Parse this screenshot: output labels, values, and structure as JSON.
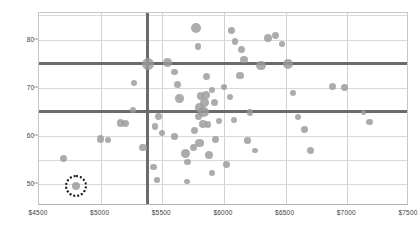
{
  "chart_data": {
    "type": "scatter",
    "title": "",
    "xlabel": "",
    "ylabel": "Treatment Recommended Conversion Rate (TRC)",
    "xlim": [
      4500,
      7500
    ],
    "ylim": [
      45.5,
      85.5
    ],
    "grid": true,
    "legend": null,
    "xticks": [
      "$4500",
      "$5000",
      "$5500",
      "$6000",
      "$6500",
      "$7000",
      "$7500"
    ],
    "xtick_values": [
      4500,
      5000,
      5500,
      6000,
      6500,
      7000,
      7500
    ],
    "yticks": [
      "80",
      "70",
      "60",
      "50"
    ],
    "ytick_values": [
      80,
      70,
      60,
      50
    ],
    "reference_lines": {
      "vertical_x": 5380,
      "horizontal_y": [
        75,
        65
      ],
      "color": "#6b6b6b"
    },
    "marker_color": "#9a9a9a",
    "highlight": {
      "style": "dotted-circle",
      "color": "#1a1a1a",
      "x": 4800,
      "y": 49.6
    },
    "points": [
      {
        "x": 4800,
        "y": 49.6,
        "r": 4.2,
        "highlighted": true
      },
      {
        "x": 4700,
        "y": 55.3,
        "r": 3.4
      },
      {
        "x": 5000,
        "y": 59.4,
        "r": 3.6
      },
      {
        "x": 5060,
        "y": 59.2,
        "r": 3.0
      },
      {
        "x": 5160,
        "y": 62.7,
        "r": 3.6
      },
      {
        "x": 5200,
        "y": 62.6,
        "r": 3.4
      },
      {
        "x": 5345,
        "y": 57.6,
        "r": 3.8
      },
      {
        "x": 5430,
        "y": 53.6,
        "r": 3.4
      },
      {
        "x": 5455,
        "y": 50.9,
        "r": 2.8
      },
      {
        "x": 5440,
        "y": 62.0,
        "r": 3.2
      },
      {
        "x": 5470,
        "y": 64.0,
        "r": 3.4
      },
      {
        "x": 5500,
        "y": 60.6,
        "r": 3.0
      },
      {
        "x": 5385,
        "y": 74.9,
        "r": 5.8
      },
      {
        "x": 5545,
        "y": 75.3,
        "r": 4.4
      },
      {
        "x": 5600,
        "y": 73.3,
        "r": 3.2
      },
      {
        "x": 5620,
        "y": 70.6,
        "r": 3.6
      },
      {
        "x": 5640,
        "y": 67.8,
        "r": 4.2
      },
      {
        "x": 5260,
        "y": 65.4,
        "r": 3.2
      },
      {
        "x": 5690,
        "y": 56.4,
        "r": 4.4
      },
      {
        "x": 5705,
        "y": 54.6,
        "r": 3.2
      },
      {
        "x": 5775,
        "y": 82.4,
        "r": 5.2
      },
      {
        "x": 5790,
        "y": 78.5,
        "r": 3.4
      },
      {
        "x": 5860,
        "y": 72.3,
        "r": 3.6
      },
      {
        "x": 5900,
        "y": 69.6,
        "r": 3.0
      },
      {
        "x": 5920,
        "y": 66.9,
        "r": 3.6
      },
      {
        "x": 5800,
        "y": 65.9,
        "r": 4.6
      },
      {
        "x": 5835,
        "y": 65.0,
        "r": 5.2
      },
      {
        "x": 5845,
        "y": 67.0,
        "r": 4.4
      },
      {
        "x": 5855,
        "y": 68.6,
        "r": 4.0
      },
      {
        "x": 5810,
        "y": 68.3,
        "r": 3.6
      },
      {
        "x": 5790,
        "y": 64.0,
        "r": 3.6
      },
      {
        "x": 5830,
        "y": 62.5,
        "r": 3.8
      },
      {
        "x": 5870,
        "y": 62.4,
        "r": 3.4
      },
      {
        "x": 5760,
        "y": 61.1,
        "r": 3.4
      },
      {
        "x": 5800,
        "y": 58.6,
        "r": 4.2
      },
      {
        "x": 5750,
        "y": 57.6,
        "r": 3.6
      },
      {
        "x": 5880,
        "y": 56.0,
        "r": 4.0
      },
      {
        "x": 5930,
        "y": 59.2,
        "r": 3.4
      },
      {
        "x": 5960,
        "y": 63.1,
        "r": 3.2
      },
      {
        "x": 6000,
        "y": 70.2,
        "r": 3.0
      },
      {
        "x": 6090,
        "y": 79.6,
        "r": 3.4
      },
      {
        "x": 6140,
        "y": 78.0,
        "r": 3.6
      },
      {
        "x": 6160,
        "y": 75.9,
        "r": 3.8
      },
      {
        "x": 6130,
        "y": 72.6,
        "r": 3.6
      },
      {
        "x": 6060,
        "y": 81.9,
        "r": 3.4
      },
      {
        "x": 6050,
        "y": 68.1,
        "r": 3.2
      },
      {
        "x": 6210,
        "y": 64.9,
        "r": 3.4
      },
      {
        "x": 6190,
        "y": 59.1,
        "r": 3.2
      },
      {
        "x": 6250,
        "y": 57.0,
        "r": 2.8
      },
      {
        "x": 6300,
        "y": 74.6,
        "r": 4.8
      },
      {
        "x": 6360,
        "y": 80.4,
        "r": 4.0
      },
      {
        "x": 6420,
        "y": 80.8,
        "r": 3.4
      },
      {
        "x": 6470,
        "y": 79.1,
        "r": 3.0
      },
      {
        "x": 6520,
        "y": 75.0,
        "r": 5.0
      },
      {
        "x": 6560,
        "y": 68.9,
        "r": 3.0
      },
      {
        "x": 6600,
        "y": 64.0,
        "r": 3.2
      },
      {
        "x": 6650,
        "y": 61.3,
        "r": 3.4
      },
      {
        "x": 6700,
        "y": 57.0,
        "r": 3.8
      },
      {
        "x": 6880,
        "y": 70.2,
        "r": 3.6
      },
      {
        "x": 6980,
        "y": 70.0,
        "r": 3.4
      },
      {
        "x": 7130,
        "y": 64.8,
        "r": 2.6
      },
      {
        "x": 7180,
        "y": 62.9,
        "r": 3.4
      },
      {
        "x": 5270,
        "y": 71.0,
        "r": 3.0
      },
      {
        "x": 6020,
        "y": 54.1,
        "r": 3.4
      },
      {
        "x": 5900,
        "y": 52.3,
        "r": 3.0
      },
      {
        "x": 5700,
        "y": 50.6,
        "r": 2.8
      },
      {
        "x": 5600,
        "y": 59.9,
        "r": 3.2
      },
      {
        "x": 6080,
        "y": 63.3,
        "r": 3.2
      }
    ]
  }
}
